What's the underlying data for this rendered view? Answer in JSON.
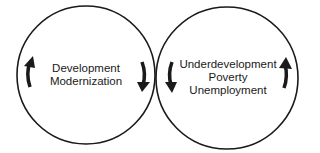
{
  "diagram": {
    "left_circle": {
      "lines": [
        "Development",
        "Modernization"
      ],
      "arrows": [
        "arrow-up-left",
        "arrow-down-right"
      ]
    },
    "right_circle": {
      "lines": [
        "Underdevelopment",
        "Poverty",
        "Unemployment"
      ],
      "arrows": [
        "arrow-down-left",
        "arrow-up-right"
      ]
    },
    "colors": {
      "stroke": "#1a1a1a",
      "background": "#ffffff"
    }
  }
}
